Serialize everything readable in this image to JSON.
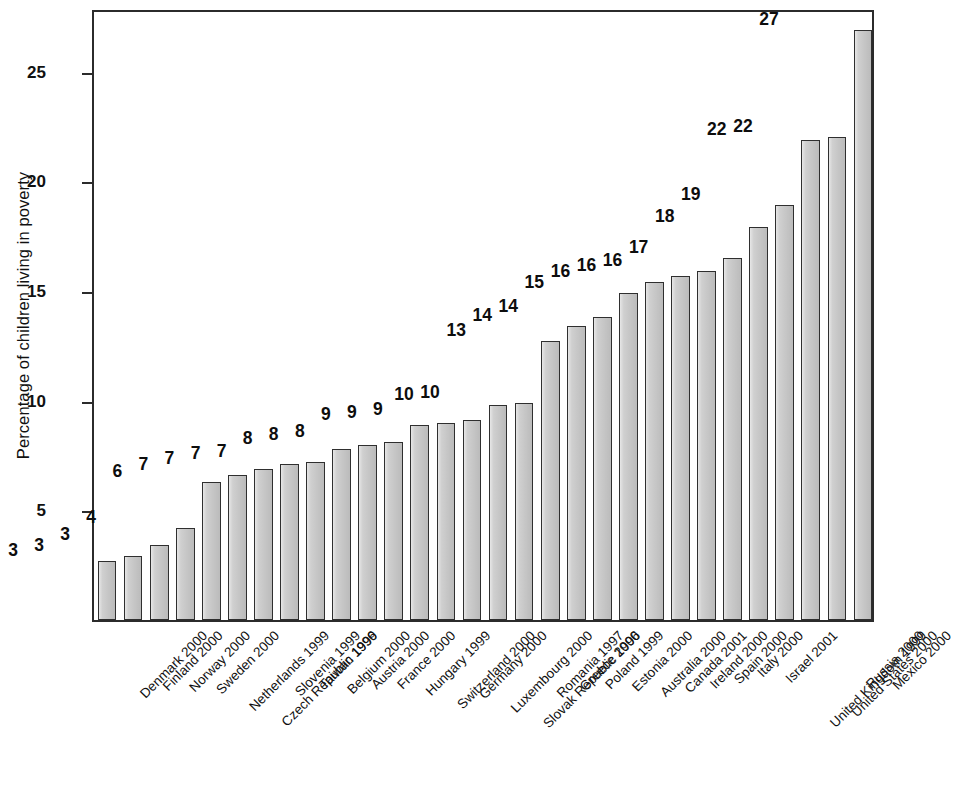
{
  "chart_data": {
    "type": "bar",
    "title": "",
    "subtitle": "",
    "xlabel": "",
    "ylabel": "Percentage of children living in poverty",
    "ylim": [
      0,
      27.9
    ],
    "yticks": [
      5,
      10,
      15,
      20,
      25
    ],
    "ytick_labels": [
      "5",
      "10",
      "15",
      "20",
      "25"
    ],
    "grid": false,
    "legend": null,
    "bar_fill_color": "#c9c9c9",
    "bar_edge_color": "#2f2f2f",
    "axis_color": "#2b2b2b",
    "categories": [
      "Denmark 2000",
      "Finland 2000",
      "Norway 2000",
      "Sweden 2000",
      "Netherlands 1999",
      "Czech Republic 1996",
      "Slovenia 1999",
      "Taiwan 1999",
      "Belgium 2000",
      "Austria 2000",
      "France 2000",
      "Hungary 1999",
      "Switzerland 2000",
      "Germany 2000",
      "Luxembourg 2000",
      "Slovak Republic 1996",
      "Romania 1997",
      "Greece 2000",
      "Poland 1999",
      "Estonia 2000",
      "Australia 2000",
      "Canada 2001",
      "Ireland 2000",
      "Spain 2000",
      "Italy 2000",
      "Israel 2001",
      "United Kingdom 1999",
      "United States 2000",
      "Russia 2000",
      "Mexico 2000"
    ],
    "values": [
      2.7,
      2.9,
      3.4,
      4.2,
      6.3,
      6.6,
      6.9,
      7.1,
      7.2,
      7.8,
      8.0,
      8.1,
      8.9,
      9.0,
      9.1,
      9.8,
      9.9,
      12.7,
      13.4,
      13.8,
      14.9,
      15.4,
      15.7,
      15.9,
      16.5,
      17.9,
      18.9,
      21.9,
      22.0,
      26.9
    ],
    "value_labels": [
      "3",
      "3",
      "3",
      "4",
      "6",
      "7",
      "7",
      "7",
      "7",
      "8",
      "8",
      "8",
      "9",
      "9",
      "9",
      "10",
      "10",
      "13",
      "14",
      "14",
      "15",
      "16",
      "16",
      "16",
      "17",
      "18",
      "19",
      "22",
      "22",
      "27"
    ]
  }
}
